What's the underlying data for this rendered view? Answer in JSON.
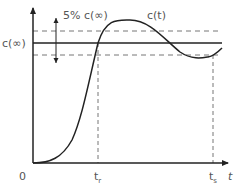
{
  "diagram": {
    "type": "step-response",
    "labels": {
      "y_final": "c(∞)",
      "tolerance": "5% c(∞)",
      "curve": "c(t)",
      "origin": "0",
      "rise_time_base": "t",
      "rise_time_sub": "r",
      "settling_time_base": "t",
      "settling_time_sub": "s",
      "x_axis": "t"
    },
    "colors": {
      "axis": "#222222",
      "curve": "#222222",
      "dashed": "#777777",
      "text": "#555555"
    }
  }
}
